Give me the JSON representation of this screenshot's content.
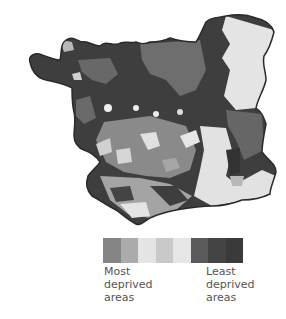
{
  "map": {
    "description": "Choropleth map of deprivation by area",
    "outline_color": "#2a2a2a",
    "shades": {
      "darkest": "#3c3c3c",
      "dark": "#555555",
      "medium": "#7d7d7d",
      "medium_light": "#a8a8a8",
      "light": "#cfcfcf",
      "lightest": "#e6e6e6"
    }
  },
  "legend": {
    "swatches": [
      "#858585",
      "#ababab",
      "#e4e4e4",
      "#c9c9c9",
      "#e6e6e6",
      "#5a5a5a",
      "#444444",
      "#3a3a3a"
    ],
    "most_label": "Most\ndeprived\nareas",
    "least_label": "Least\ndeprived\nareas"
  }
}
